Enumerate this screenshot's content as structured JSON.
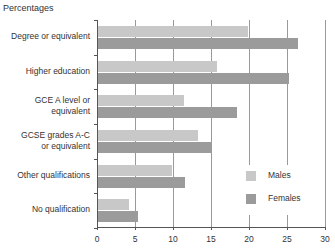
{
  "chart_data": {
    "type": "bar",
    "orientation": "horizontal",
    "title": "",
    "ylabel": "Percentages",
    "xlabel": "",
    "categories": [
      "Degree or equivalent",
      "Higher education",
      "GCE A level or equivalent",
      "GCSE grades A-C or equivalent",
      "Other qualifications",
      "No qualification"
    ],
    "series": [
      {
        "name": "Males",
        "color": "#c8c8c8",
        "values": [
          19.7,
          15.7,
          11.3,
          13.2,
          9.8,
          4.1
        ]
      },
      {
        "name": "Females",
        "color": "#9b9b9b",
        "values": [
          26.3,
          25.1,
          18.3,
          15.0,
          11.4,
          5.3
        ]
      }
    ],
    "xlim": [
      0,
      30
    ],
    "xticks": [
      "0",
      "5",
      "10",
      "15",
      "20",
      "25",
      "30"
    ],
    "grid": "vertical",
    "legend_position": "lower right inside"
  },
  "labels": {
    "y_title": "Percentages",
    "categories": [
      [
        "Degree or equivalent"
      ],
      [
        "Higher education"
      ],
      [
        "GCE A level or",
        "equivalent"
      ],
      [
        "GCSE grades A-C",
        "or equivalent"
      ],
      [
        "Other qualifications"
      ],
      [
        "No qualification"
      ]
    ],
    "xticks": [
      "0",
      "5",
      "10",
      "15",
      "20",
      "25",
      "30"
    ],
    "legend": {
      "males": "Males",
      "females": "Females"
    }
  }
}
